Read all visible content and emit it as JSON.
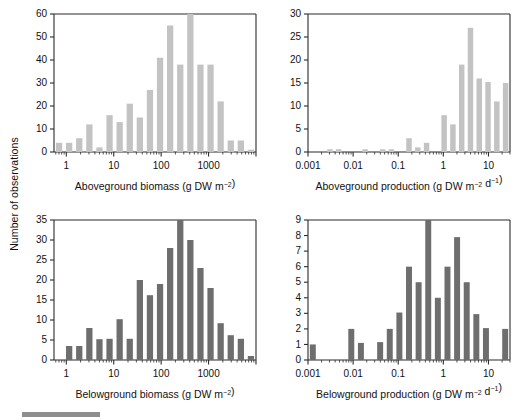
{
  "figure": {
    "shared_ylabel": "Number of observations",
    "panel_count": 4
  },
  "chart_data": [
    {
      "id": "aboveground-biomass",
      "type": "bar",
      "title": "",
      "xlabel": "Aboveground biomass (g DW m−2)",
      "ylabel": "Number of observations",
      "xscale": "log",
      "xlim": [
        0.55,
        10000
      ],
      "ylim": [
        0,
        60
      ],
      "yticks": [
        0,
        10,
        20,
        30,
        40,
        50,
        60
      ],
      "xticks": [
        1,
        10,
        100,
        1000
      ],
      "xtick_labels": [
        "1",
        "10",
        "100",
        "1000"
      ],
      "grid": false,
      "legend": "none",
      "bar_color": "#c3c3c3",
      "bin_edges_log10": [
        -0.25,
        0.0,
        0.25,
        0.5,
        0.75,
        1.0,
        1.25,
        1.5,
        1.75,
        2.0,
        2.25,
        2.5,
        2.75,
        3.0,
        3.25,
        3.5,
        3.75,
        4.0
      ],
      "categories": [
        "0.56-1",
        "1-1.8",
        "1.8-3.2",
        "3.2-5.6",
        "5.6-10",
        "10-18",
        "18-32",
        "32-56",
        "56-100",
        "100-180",
        "180-320",
        "320-560",
        "560-1000",
        "1000-1800",
        "1800-3200",
        "3200-5600",
        "5600-10000"
      ],
      "values": [
        4,
        4,
        6,
        12,
        2,
        16,
        13,
        21,
        15,
        27,
        41,
        55,
        38,
        60,
        38,
        38,
        22,
        5,
        5,
        1
      ]
    },
    {
      "id": "aboveground-production",
      "type": "bar",
      "title": "",
      "xlabel": "Aboveground production (g DW m−2 d−1)",
      "ylabel": "Number of observations",
      "xscale": "log",
      "xlim": [
        0.001,
        30
      ],
      "ylim": [
        0,
        30
      ],
      "yticks": [
        0,
        5,
        10,
        15,
        20,
        25,
        30
      ],
      "xticks": [
        0.001,
        0.01,
        0.1,
        1,
        10
      ],
      "xtick_labels": [
        "0.001",
        "0.01",
        "0.1",
        "1",
        "10"
      ],
      "grid": false,
      "legend": "none",
      "bar_color": "#c3c3c3",
      "values": [
        0,
        0,
        0.6,
        0.6,
        0,
        0,
        0.6,
        0,
        0.6,
        0.6,
        0,
        3,
        1,
        2,
        0,
        8,
        6,
        19,
        27,
        16,
        15.2,
        11,
        15
      ]
    },
    {
      "id": "belowground-biomass",
      "type": "bar",
      "title": "",
      "xlabel": "Belowground biomass (g DW m−2)",
      "ylabel": "Number of observations",
      "xscale": "log",
      "xlim": [
        0.55,
        10000
      ],
      "ylim": [
        0,
        35
      ],
      "yticks": [
        0,
        5,
        10,
        15,
        20,
        25,
        30,
        35
      ],
      "xticks": [
        1,
        10,
        100,
        1000
      ],
      "xtick_labels": [
        "1",
        "10",
        "100",
        "1000"
      ],
      "grid": false,
      "legend": "none",
      "bar_color": "#6e6e6e",
      "values": [
        0,
        3.5,
        3.5,
        8,
        5.2,
        5.3,
        10.2,
        5.3,
        20,
        16.2,
        19,
        28,
        35,
        30,
        23,
        18,
        9.2,
        6.2,
        5.3,
        1
      ]
    },
    {
      "id": "belowground-production",
      "type": "bar",
      "title": "",
      "xlabel": "Belowground production (g DW m−2 d−1)",
      "ylabel": "Number of observations",
      "xscale": "log",
      "xlim": [
        0.001,
        30
      ],
      "ylim": [
        0,
        9
      ],
      "yticks": [
        0,
        1,
        2,
        3,
        4,
        5,
        6,
        7,
        8,
        9
      ],
      "xticks": [
        0.001,
        0.01,
        0.1,
        1,
        10
      ],
      "xtick_labels": [
        "0.001",
        "0.01",
        "0.1",
        "1",
        "10"
      ],
      "grid": false,
      "legend": "none",
      "bar_color": "#6e6e6e",
      "values": [
        1,
        0,
        0,
        0,
        2,
        1.1,
        0,
        1.15,
        2,
        3.05,
        6,
        5,
        9,
        4,
        6,
        7.9,
        5,
        2.95,
        2.05,
        0,
        2
      ]
    }
  ]
}
